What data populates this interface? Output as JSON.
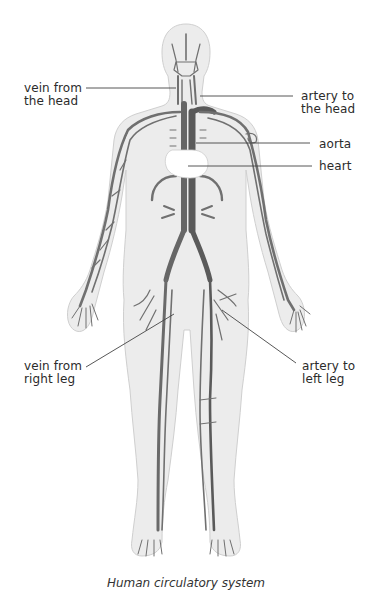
{
  "diagram": {
    "type": "anatomical-illustration",
    "subject": "Human circulatory system",
    "colors": {
      "body_fill": "#ececec",
      "body_outline": "#c8c8c8",
      "vessel": "#6e6e6e",
      "vessel_light": "#8a8a8a",
      "heart": "#ffffff",
      "leader_line": "#444444",
      "text": "#2b2b2b"
    },
    "labels": [
      {
        "id": "vein-head",
        "text": "vein from\nthe head",
        "side": "left"
      },
      {
        "id": "artery-head",
        "text": "artery to\nthe head",
        "side": "right"
      },
      {
        "id": "aorta",
        "text": "aorta",
        "side": "right"
      },
      {
        "id": "heart",
        "text": "heart",
        "side": "right"
      },
      {
        "id": "vein-right-leg",
        "text": "vein from\nright leg",
        "side": "left"
      },
      {
        "id": "artery-left-leg",
        "text": "artery to\nleft leg",
        "side": "right"
      }
    ],
    "caption": "Human circulatory system"
  }
}
